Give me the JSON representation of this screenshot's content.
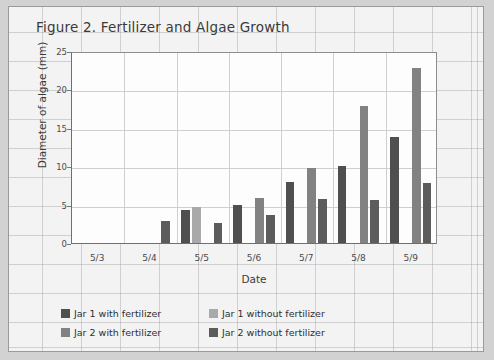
{
  "figure": {
    "title": "Figure 2. Fertilizer and Algae Growth"
  },
  "chart_data": {
    "type": "bar",
    "title": "Figure 2. Fertilizer and Algae Growth",
    "xlabel": "Date",
    "ylabel": "Diameter of algae (mm)",
    "categories": [
      "5/3",
      "5/4",
      "5/5",
      "5/6",
      "5/7",
      "5/8",
      "5/9"
    ],
    "ylim": [
      0,
      25
    ],
    "yticks": [
      0,
      5,
      10,
      15,
      20,
      25
    ],
    "ytick_labels": [
      "0",
      "5",
      "10",
      "15",
      "20",
      "25"
    ],
    "grid": true,
    "legend_position": "bottom-left",
    "series": [
      {
        "name": "Jar 1 with fertilizer",
        "color": "#4f4f4f",
        "values": [
          0,
          0,
          4.3,
          4.9,
          7.9,
          10.0,
          13.8
        ]
      },
      {
        "name": "Jar 1 without fertilizer",
        "color": "#a9a9a9",
        "values": [
          0,
          0,
          4.7,
          0,
          0,
          0,
          0
        ]
      },
      {
        "name": "Jar 2 with fertilizer",
        "color": "#828282",
        "values": [
          0,
          0,
          0,
          5.9,
          9.8,
          17.8,
          22.8
        ]
      },
      {
        "name": "Jar 2 without fertilizer",
        "color": "#5c5c5c",
        "values": [
          0,
          2.9,
          2.6,
          3.6,
          5.7,
          5.6,
          7.8
        ]
      }
    ]
  }
}
